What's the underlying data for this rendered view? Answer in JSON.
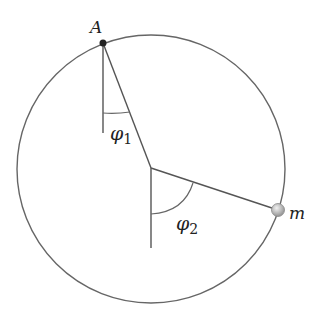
{
  "diagram": {
    "type": "double pendulum in circle",
    "labels": {
      "point_a": "A",
      "mass": "m",
      "angle1_symbol": "φ",
      "angle1_sub": "1",
      "angle2_symbol": "φ",
      "angle2_sub": "2"
    },
    "colors": {
      "line": "#555555",
      "point_a": "#222222",
      "mass_fill": "#bbbbbb",
      "background": "#ffffff"
    }
  }
}
